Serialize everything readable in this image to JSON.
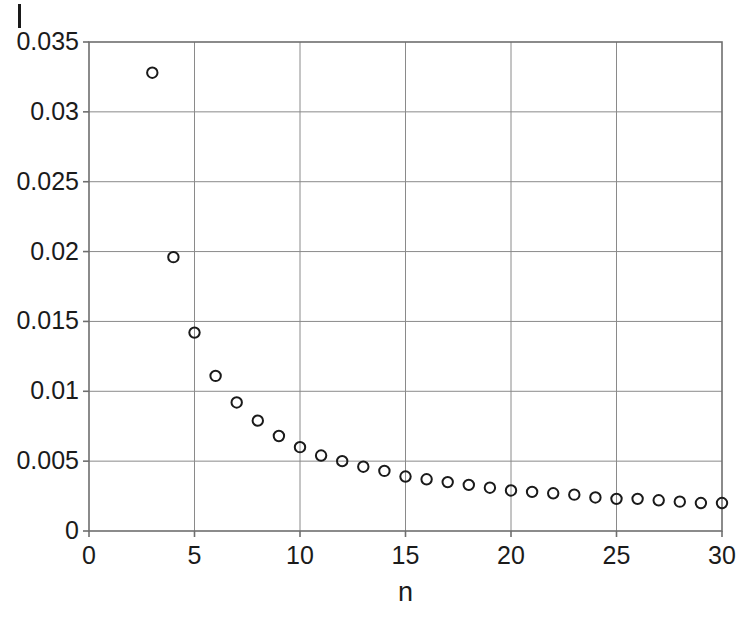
{
  "figure": {
    "background_color": "#ffffff",
    "axis_color": "#6e6e6e",
    "grid_color": "#8a8a8a",
    "marker_color": "#1a1a1a",
    "stray_mark_label": "I"
  },
  "chart_data": {
    "type": "scatter",
    "title": "",
    "xlabel": "n",
    "ylabel": "",
    "xlim": [
      0,
      30
    ],
    "ylim": [
      0,
      0.035
    ],
    "grid": true,
    "legend": null,
    "marker": "open-circle",
    "xticks": [
      0,
      5,
      10,
      15,
      20,
      25,
      30
    ],
    "xtick_labels": [
      "0",
      "5",
      "10",
      "15",
      "20",
      "25",
      "30"
    ],
    "yticks": [
      0,
      0.005,
      0.01,
      0.015,
      0.02,
      0.025,
      0.03,
      0.035
    ],
    "ytick_labels": [
      "0",
      "0.005",
      "0.01",
      "0.015",
      "0.02",
      "0.025",
      "0.03",
      "0.035"
    ],
    "x": [
      3,
      4,
      5,
      6,
      7,
      8,
      9,
      10,
      11,
      12,
      13,
      14,
      15,
      16,
      17,
      18,
      19,
      20,
      21,
      22,
      23,
      24,
      25,
      26,
      27,
      28,
      29,
      30
    ],
    "y": [
      0.0328,
      0.0196,
      0.0142,
      0.0111,
      0.0092,
      0.0079,
      0.0068,
      0.006,
      0.0054,
      0.005,
      0.0046,
      0.0043,
      0.0039,
      0.0037,
      0.0035,
      0.0033,
      0.0031,
      0.0029,
      0.0028,
      0.0027,
      0.0026,
      0.0024,
      0.0023,
      0.0023,
      0.0022,
      0.0021,
      0.002,
      0.002
    ],
    "series": [
      {
        "name": "series-1",
        "marker": "open-circle",
        "values": [
          0.0328,
          0.0196,
          0.0142,
          0.0111,
          0.0092,
          0.0079,
          0.0068,
          0.006,
          0.0054,
          0.005,
          0.0046,
          0.0043,
          0.0039,
          0.0037,
          0.0035,
          0.0033,
          0.0031,
          0.0029,
          0.0028,
          0.0027,
          0.0026,
          0.0024,
          0.0023,
          0.0023,
          0.0022,
          0.0021,
          0.002,
          0.002
        ]
      }
    ]
  }
}
